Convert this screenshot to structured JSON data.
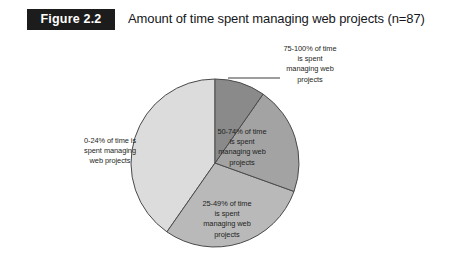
{
  "figure": {
    "tag": "Figure 2.2",
    "title": "Amount of time spent managing web projects (n=87)"
  },
  "chart_data": {
    "type": "pie",
    "title": "Amount of time spent managing web projects (n=87)",
    "sample_size": "n=87",
    "categories": [
      "75-100% of time is spent managing web projects",
      "50-74% of time is spent managing web projects",
      "25-49% of time is spent managing web projects",
      "0-24% of time is spent managing web projects"
    ],
    "values": [
      9.7,
      20.8,
      29.2,
      40.3
    ],
    "value_unit": "percent of respondents",
    "slice_colors": [
      "#8a8a8a",
      "#a3a3a3",
      "#b9b9b9",
      "#dcdcdc"
    ],
    "legend": "none",
    "labels_position": "inside-slices-with-one-callout",
    "slices": [
      {
        "name": "75-100% of time is spent managing web projects",
        "label_lines": [
          "75-100% of time",
          "is spent",
          "managing web",
          "projects"
        ],
        "value": 9.7,
        "color": "#8a8a8a",
        "label_placement": "callout"
      },
      {
        "name": "50-74% of time is spent managing web projects",
        "label_lines": [
          "50-74% of time",
          "is spent",
          "managing web",
          "projects"
        ],
        "value": 20.8,
        "color": "#a3a3a3",
        "label_placement": "inside"
      },
      {
        "name": "25-49% of time is spent managing web projects",
        "label_lines": [
          "25-49% of time",
          "is spent",
          "managing web",
          "projects"
        ],
        "value": 29.2,
        "color": "#b9b9b9",
        "label_placement": "inside"
      },
      {
        "name": "0-24% of time is spent managing web projects",
        "label_lines": [
          "0-24% of time is",
          "spent managing",
          "web projects"
        ],
        "value": 40.3,
        "color": "#dcdcdc",
        "label_placement": "inside"
      }
    ]
  },
  "labels": {
    "slice_0_24": "0-24% of time is\nspent managing\nweb projects",
    "slice_50_74": "50-74% of time\nis spent\nmanaging web\nprojects",
    "slice_25_49": "25-49% of time\nis spent\nmanaging web\nprojects",
    "slice_75_100": "75-100% of time\nis spent\nmanaging web\nprojects"
  },
  "colors": {
    "tag_background": "#1c1c1c",
    "tag_text": "#ffffff",
    "page_background": "#ffffff",
    "slice_outline": "#4a4a4a",
    "leader_line": "#3d3d3d",
    "text": "#1d1f22"
  }
}
